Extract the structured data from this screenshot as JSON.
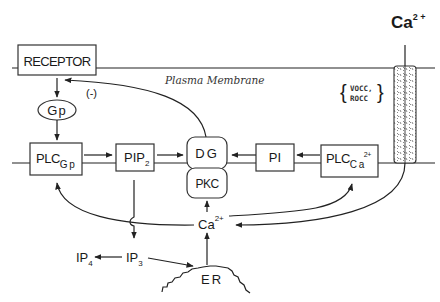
{
  "diagram": {
    "membrane_label": "Plasma Membrane",
    "nodes": {
      "receptor": "RECEPTOR",
      "gp": "Gp",
      "plc_gp": {
        "main": "PLC",
        "sub": "G p"
      },
      "pip2": {
        "main": "PIP",
        "sub": "2"
      },
      "dg": "DG",
      "pkc": "PKC",
      "pi": "PI",
      "plc_ca": {
        "main": "PLC",
        "sub": "C a",
        "sup": "2+"
      },
      "ca_center": {
        "main": "Ca",
        "sup": "2+"
      },
      "ip3": {
        "main": "IP",
        "sub": "3"
      },
      "ip4": {
        "main": "IP",
        "sub": "4"
      },
      "er": "ER",
      "ca_ext": {
        "main": "Ca",
        "sup": "2 +"
      }
    },
    "annotations": {
      "negative_feedback": "(-)",
      "channel_line1": "VOCC,",
      "channel_line2": "ROCC"
    },
    "edges": [
      {
        "from": "RECEPTOR",
        "to": "Gp"
      },
      {
        "from": "Gp",
        "to": "PLC_Gp"
      },
      {
        "from": "PLC_Gp",
        "to": "PIP2"
      },
      {
        "from": "PIP2",
        "to": "DG"
      },
      {
        "from": "PIP2",
        "to": "IP3"
      },
      {
        "from": "DG",
        "to": "RECEPTOR",
        "label": "(-)"
      },
      {
        "from": "PLC_Ca2+",
        "to": "PI"
      },
      {
        "from": "PI",
        "to": "DG"
      },
      {
        "from": "IP3",
        "to": "IP4"
      },
      {
        "from": "IP3",
        "to": "ER"
      },
      {
        "from": "ER",
        "to": "Ca2+"
      },
      {
        "from": "Ca2+",
        "to": "PKC"
      },
      {
        "from": "Ca2+",
        "to": "PLC_Gp"
      },
      {
        "from": "Ca2+",
        "to": "PLC_Ca2+"
      },
      {
        "from": "Ca2+ channel",
        "to": "Ca2+"
      }
    ],
    "colors": {
      "line": "#222222",
      "background": "#ffffff"
    }
  }
}
